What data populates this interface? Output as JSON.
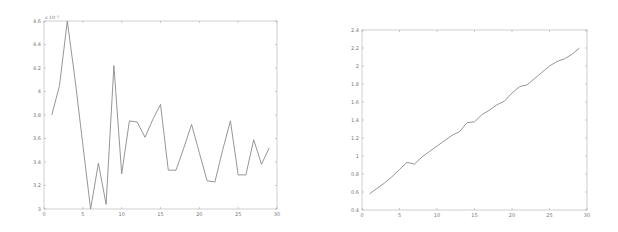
{
  "chart_data": [
    {
      "type": "line",
      "title": "",
      "xlabel": "",
      "ylabel": "",
      "y_multiplier_label": "x 10⁻³",
      "xlim": [
        0,
        30
      ],
      "ylim": [
        3.0,
        4.6
      ],
      "x_ticks": [
        0,
        5,
        10,
        15,
        20,
        25,
        30
      ],
      "x_tick_labels": [
        "0",
        "5",
        "10",
        "15",
        "20",
        "25",
        "30"
      ],
      "y_ticks": [
        3.0,
        3.2,
        3.4,
        3.6,
        3.8,
        4.0,
        4.2,
        4.4,
        4.6
      ],
      "y_tick_labels": [
        "3",
        "3.2",
        "3.4",
        "3.6",
        "3.8",
        "4",
        "4.2",
        "4.4",
        "4.6"
      ],
      "grid": false,
      "legend": null,
      "series": [
        {
          "name": "series1",
          "color": "#8a8a8a",
          "x": [
            1,
            2,
            3,
            4,
            5,
            6,
            7,
            8,
            9,
            10,
            11,
            12,
            13,
            14,
            15,
            16,
            17,
            18,
            19,
            20,
            21,
            22,
            23,
            24,
            25,
            26,
            27,
            28,
            29
          ],
          "values": [
            3.8,
            4.05,
            4.6,
            4.1,
            3.55,
            3.0,
            3.39,
            3.04,
            4.22,
            3.3,
            3.75,
            3.74,
            3.61,
            3.76,
            3.89,
            3.33,
            3.33,
            3.52,
            3.72,
            3.48,
            3.24,
            3.23,
            3.5,
            3.75,
            3.29,
            3.29,
            3.59,
            3.38,
            3.52
          ]
        }
      ]
    },
    {
      "type": "line",
      "title": "",
      "xlabel": "",
      "ylabel": "",
      "xlim": [
        0,
        30
      ],
      "ylim": [
        0.4,
        2.4
      ],
      "x_ticks": [
        0,
        5,
        10,
        15,
        20,
        25,
        30
      ],
      "x_tick_labels": [
        "0",
        "5",
        "10",
        "15",
        "20",
        "25",
        "30"
      ],
      "y_ticks": [
        0.4,
        0.6,
        0.8,
        1.0,
        1.2,
        1.4,
        1.6,
        1.8,
        2.0,
        2.2,
        2.4
      ],
      "y_tick_labels": [
        "0.4",
        "0.6",
        "0.8",
        "1",
        "1.2",
        "1.4",
        "1.6",
        "1.8",
        "2",
        "2.2",
        "2.4"
      ],
      "grid": false,
      "legend": null,
      "series": [
        {
          "name": "series1",
          "color": "#8a8a8a",
          "x": [
            1,
            2,
            3,
            4,
            5,
            6,
            7,
            8,
            9,
            10,
            11,
            12,
            13,
            14,
            15,
            16,
            17,
            18,
            19,
            20,
            21,
            22,
            23,
            24,
            25,
            26,
            27,
            28,
            29
          ],
          "values": [
            0.58,
            0.64,
            0.7,
            0.77,
            0.85,
            0.93,
            0.91,
            0.99,
            1.05,
            1.11,
            1.17,
            1.23,
            1.27,
            1.37,
            1.38,
            1.46,
            1.51,
            1.57,
            1.61,
            1.7,
            1.77,
            1.79,
            1.86,
            1.93,
            2.0,
            2.05,
            2.08,
            2.13,
            2.2
          ]
        }
      ]
    }
  ]
}
